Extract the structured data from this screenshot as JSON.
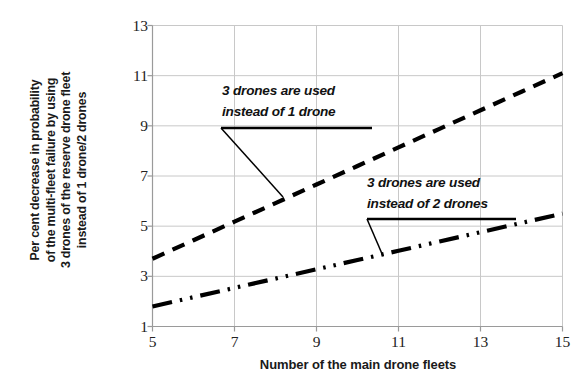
{
  "chart_data": {
    "type": "line",
    "title": "",
    "subtitle": "",
    "xlabel": "Number of the main drone fleets",
    "ylabel": "Per cent decrease in probability of the multi-fleet failure by using 3 drones of the reserve drone fleet instead of 1 drone/2 drones",
    "ylabel_lines": [
      "Per cent decrease in probability",
      "of the multi-fleet failure by using",
      "3 drones of the reserve drone fleet",
      "instead of 1 drone/2 drones"
    ],
    "xlim": [
      5,
      15
    ],
    "ylim": [
      1,
      13
    ],
    "xticks": [
      "5",
      "7",
      "9",
      "11",
      "13",
      "15"
    ],
    "yticks": [
      "1",
      "3",
      "5",
      "7",
      "9",
      "11",
      "13"
    ],
    "xtick_values": [
      5,
      7,
      9,
      11,
      13,
      15
    ],
    "ytick_values": [
      1,
      3,
      5,
      7,
      9,
      11,
      13
    ],
    "grid": true,
    "grid_color": "#c8c8c8",
    "legend": "none",
    "x": [
      5,
      6,
      7,
      8,
      9,
      10,
      11,
      12,
      13,
      14,
      15
    ],
    "series": [
      {
        "name": "3 drones are used instead of 1 drone",
        "style": "dashed",
        "color": "#000000",
        "values": [
          3.7,
          4.44,
          5.18,
          5.92,
          6.66,
          7.4,
          8.14,
          8.88,
          9.62,
          10.36,
          11.1
        ]
      },
      {
        "name": "3 drones are used instead of 2 drones",
        "style": "dash-dot-dot",
        "color": "#000000",
        "values": [
          1.8,
          2.17,
          2.54,
          2.91,
          3.28,
          3.65,
          4.02,
          4.39,
          4.76,
          5.13,
          5.5
        ]
      }
    ],
    "annotations": [
      {
        "id": "annot-upper",
        "lines": [
          "3 drones are used",
          "instead of 1 drone"
        ],
        "points_to_series": "3 drones are used instead of 1 drone",
        "points_to_x": 8.2,
        "points_to_y": 6.1
      },
      {
        "id": "annot-lower",
        "lines": [
          "3 drones are used",
          "instead of 2 drones"
        ],
        "points_to_series": "3 drones are used instead of 2 drones",
        "points_to_x": 10.6,
        "points_to_y": 3.85
      }
    ]
  },
  "axes": {
    "x_title": "Number of the main drone fleets",
    "y_title_line_1": "Per cent decrease in probability",
    "y_title_line_2": "of the multi-fleet failure by using",
    "y_title_line_3": "3 drones of the reserve drone fleet",
    "y_title_line_4": "instead of 1 drone/2 drones"
  },
  "annotations": {
    "upper_line_1": "3 drones are used",
    "upper_line_2": "instead of 1 drone",
    "lower_line_1": "3 drones are used",
    "lower_line_2": "instead of 2 drones"
  },
  "artifact": {
    "top_strip": ""
  }
}
